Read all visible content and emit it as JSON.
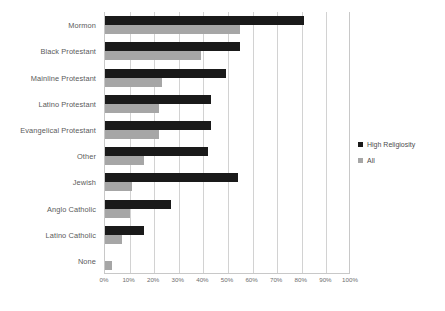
{
  "chart_data": {
    "type": "bar",
    "orientation": "horizontal",
    "title": "",
    "xlabel": "",
    "ylabel": "",
    "xlim": [
      0,
      100
    ],
    "xtick_labels": [
      "0%",
      "10%",
      "20%",
      "30%",
      "40%",
      "50%",
      "60%",
      "70%",
      "80%",
      "90%",
      "100%"
    ],
    "xtick_values": [
      0,
      10,
      20,
      30,
      40,
      50,
      60,
      70,
      80,
      90,
      100
    ],
    "grid": true,
    "legend_position": "right",
    "categories": [
      "Mormon",
      "Black Protestant",
      "Mainline Protestant",
      "Latino Protestant",
      "Evangelical Protestant",
      "Other",
      "Jewish",
      "Anglo Catholic",
      "Latino Catholic",
      "None"
    ],
    "series": [
      {
        "name": "High Religiosity",
        "color": "#1a1a1a",
        "values": [
          81,
          55,
          49,
          43,
          43,
          42,
          54,
          27,
          16,
          0
        ]
      },
      {
        "name": "All",
        "color": "#a6a6a6",
        "values": [
          55,
          39,
          23,
          22,
          22,
          16,
          11,
          10,
          7,
          3
        ]
      }
    ]
  },
  "legend": {
    "items": [
      {
        "label": "High Religiosity",
        "color": "#1a1a1a"
      },
      {
        "label": "All",
        "color": "#a6a6a6"
      }
    ]
  },
  "colors": {
    "high_religiosity": "#1a1a1a",
    "all": "#a6a6a6",
    "gridline": "#d2d2d2",
    "axis": "#c8c8c8",
    "label_text": "#5a5a5a",
    "tick_text": "#6e6e6e"
  }
}
